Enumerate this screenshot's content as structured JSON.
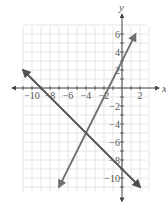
{
  "chart_data": {
    "type": "line",
    "title": "",
    "xlabel": "x",
    "ylabel": "y",
    "xlim": [
      -11,
      3
    ],
    "ylim": [
      -11.5,
      7
    ],
    "grid": true,
    "x_ticks": [
      -10,
      -8,
      -6,
      -4,
      -2,
      2
    ],
    "y_ticks": [
      6,
      4,
      2,
      -2,
      -4,
      -6,
      -8,
      -10
    ],
    "series": [
      {
        "name": "y = 2x + 3",
        "equation": "y = 2x + 3",
        "points": [
          [
            -7,
            -11
          ],
          [
            -4,
            -5
          ],
          [
            0,
            3
          ],
          [
            1.5,
            6
          ]
        ],
        "color": "#707070"
      },
      {
        "name": "y = -x - 9",
        "equation": "y = -x - 9",
        "points": [
          [
            -11,
            2
          ],
          [
            -9,
            0
          ],
          [
            -4,
            -5
          ],
          [
            0,
            -9
          ],
          [
            2,
            -11
          ]
        ],
        "color": "#505050"
      }
    ],
    "intersection": [
      -4,
      -5
    ]
  },
  "colors": {
    "grid": "#e4e4e4",
    "axis": "#444444",
    "line_rising": "#707070",
    "line_falling": "#505050"
  }
}
